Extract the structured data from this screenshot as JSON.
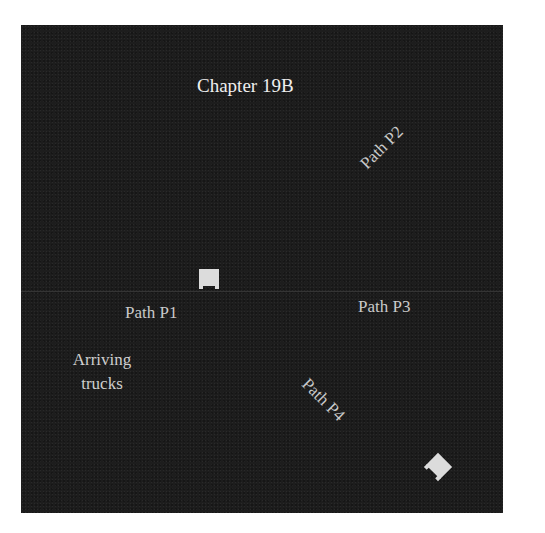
{
  "figure": {
    "title": "Chapter 19B",
    "background_color": "#1d1d1d",
    "text_color": "#d6d6d6",
    "labels": {
      "path_p1": "Path P1",
      "path_p2": "Path P2",
      "path_p3": "Path P3",
      "path_p4": "Path P4",
      "arriving_line1": "Arriving",
      "arriving_line2": "trucks"
    },
    "markers": [
      {
        "name": "truck-icon",
        "orientation_deg": 0
      },
      {
        "name": "truck-icon",
        "orientation_deg": 45
      }
    ]
  }
}
